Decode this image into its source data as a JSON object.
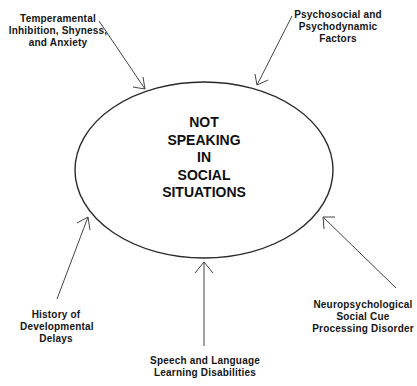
{
  "diagram": {
    "center": {
      "lines": [
        "NOT",
        "SPEAKING",
        "IN",
        "SOCIAL",
        "SITUATIONS"
      ]
    },
    "factors": [
      {
        "id": "temperamental",
        "lines": [
          "Temperamental",
          "Inhibition, Shyness,",
          "and Anxiety"
        ],
        "position": "top-left"
      },
      {
        "id": "psychosocial",
        "lines": [
          "Psychosocial and",
          "Psychodynamic",
          "Factors"
        ],
        "position": "top-right"
      },
      {
        "id": "history",
        "lines": [
          "History of",
          "Developmental",
          "Delays"
        ],
        "position": "bottom-left"
      },
      {
        "id": "speech",
        "lines": [
          "Speech and Language",
          "Learning Disabilities"
        ],
        "position": "bottom-center"
      },
      {
        "id": "neuro",
        "lines": [
          "Neuropsychological",
          "Social Cue",
          "Processing Disorder"
        ],
        "position": "bottom-right"
      }
    ],
    "colors": {
      "line": "#2a2a2a",
      "text": "#151515",
      "background": "#ffffff"
    }
  }
}
